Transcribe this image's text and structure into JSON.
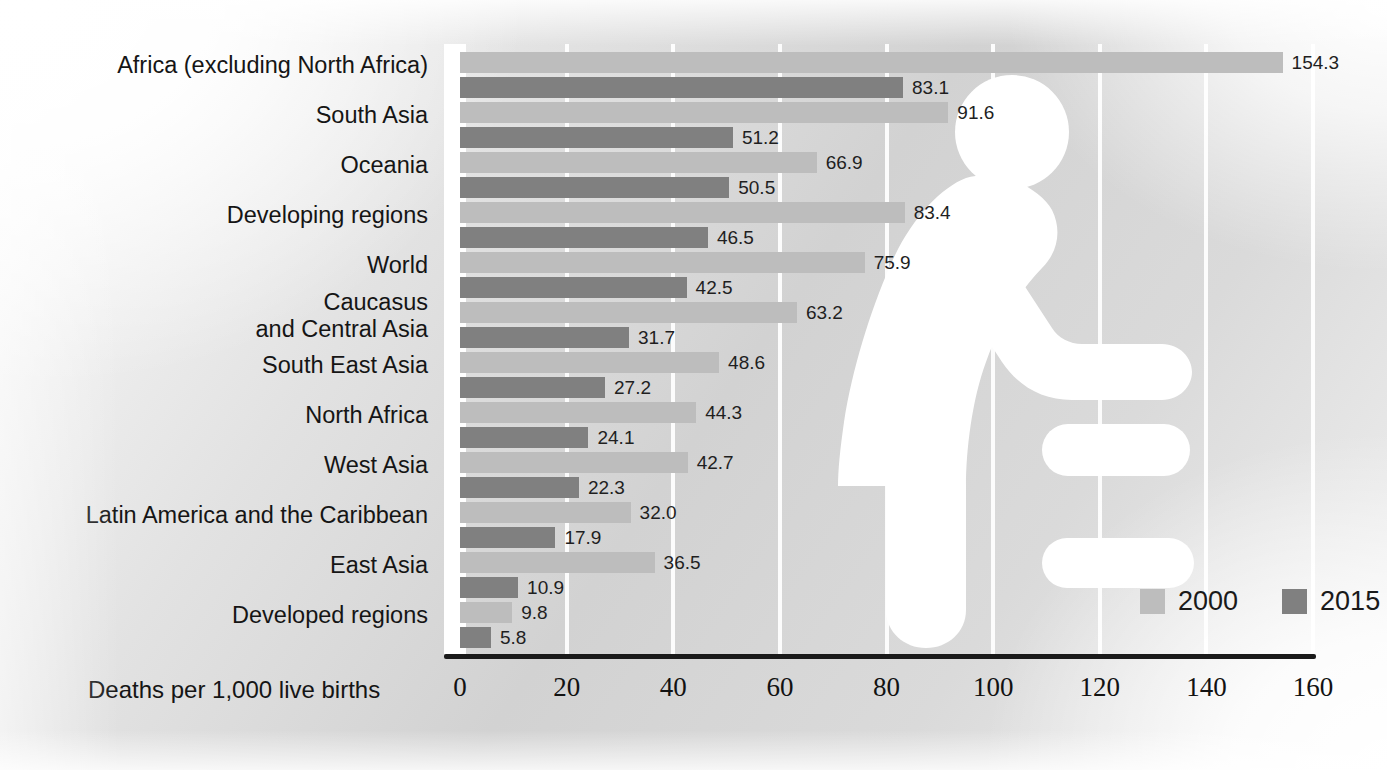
{
  "chart_data": {
    "type": "bar",
    "orientation": "horizontal",
    "title": "",
    "xlabel": "Deaths per 1,000 live births",
    "ylabel": "",
    "xlim": [
      0,
      160
    ],
    "xticks": [
      "0",
      "20",
      "40",
      "60",
      "80",
      "100",
      "120",
      "140",
      "160"
    ],
    "grid": true,
    "legend_position": "bottom-right",
    "categories": [
      "Africa (excluding North Africa)",
      "South Asia",
      "Oceania",
      "Developing regions",
      "World",
      "Caucasus\nand Central Asia",
      "South East Asia",
      "North Africa",
      "West Asia",
      "Latin America and the Caribbean",
      "East Asia",
      "Developed regions"
    ],
    "series": [
      {
        "name": "2000",
        "color": "#bdbdbd",
        "values": [
          154.3,
          91.6,
          66.9,
          83.4,
          75.9,
          63.2,
          48.6,
          44.3,
          42.7,
          32.0,
          36.5,
          9.8
        ],
        "labels": [
          "154.3",
          "91.6",
          "66.9",
          "83.4",
          "75.9",
          "63.2",
          "48.6",
          "44.3",
          "42.7",
          "32.0",
          "36.5",
          "9.8"
        ]
      },
      {
        "name": "2015",
        "color": "#808080",
        "values": [
          83.1,
          51.2,
          50.5,
          46.5,
          42.5,
          31.7,
          27.2,
          24.1,
          22.3,
          17.9,
          10.9,
          5.8
        ],
        "labels": [
          "83.1",
          "51.2",
          "50.5",
          "46.5",
          "42.5",
          "31.7",
          "27.2",
          "24.1",
          "22.3",
          "17.9",
          "10.9",
          "5.8"
        ]
      }
    ]
  },
  "legend": {
    "items": [
      {
        "label": "2000",
        "color": "#bdbdbd"
      },
      {
        "label": "2015",
        "color": "#808080"
      }
    ]
  },
  "axis": {
    "title": "Deaths per 1,000 live births",
    "ticks": [
      "0",
      "20",
      "40",
      "60",
      "80",
      "100",
      "120",
      "140",
      "160"
    ]
  },
  "decoration": {
    "silhouette": "mother-and-child-icon",
    "silhouette_color": "#ffffff"
  },
  "colors": {
    "bar_2000": "#bdbdbd",
    "bar_2015": "#808080",
    "axis_line": "#1a1a1a",
    "gridline": "#ffffff",
    "text": "#151515"
  }
}
